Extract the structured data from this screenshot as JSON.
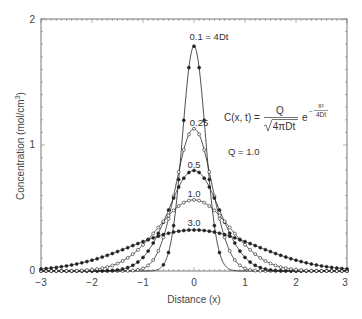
{
  "chart_data": {
    "type": "line",
    "title": "",
    "xlabel": "Distance (x)",
    "ylabel": "Concentration (mol/cm",
    "ylabel_sup": "3",
    "ylabel_end": ")",
    "xlim": [
      -3,
      3
    ],
    "ylim": [
      0,
      2
    ],
    "xticks": [
      -3,
      -2,
      -1,
      0,
      1,
      2,
      3
    ],
    "xtick_labels": [
      "−3",
      "−2",
      "−1",
      "0",
      "1",
      "2",
      "3"
    ],
    "yticks": [
      0,
      1,
      2
    ],
    "ytick_labels": [
      "0",
      "1",
      "2"
    ],
    "grid": false,
    "legend": "none (inline labels)",
    "formula": "C(x, t) = Q / sqrt(4πDt) · e^(−x²/4Dt)",
    "Q": 1.0,
    "series": [
      {
        "name": "0.1 = 4Dt",
        "s": 0.1,
        "peak": 1.784,
        "marker": "filled",
        "marker_step": 0.1
      },
      {
        "name": "0.25",
        "s": 0.25,
        "peak": 1.128,
        "marker": "open",
        "marker_step": 0.1
      },
      {
        "name": "0.5",
        "s": 0.5,
        "peak": 0.798,
        "marker": "filled",
        "marker_step": 0.1
      },
      {
        "name": "1.0",
        "s": 1.0,
        "peak": 0.564,
        "marker": "open",
        "marker_step": 0.1
      },
      {
        "name": "3.0",
        "s": 3.0,
        "peak": 0.326,
        "marker": "filled",
        "marker_step": 0.1
      }
    ]
  },
  "labels": {
    "s01": "0.1 = 4Dt",
    "s025": "0.25",
    "s05": "0.5",
    "s10": "1.0",
    "s30": "3.0",
    "q": "Q = 1.0",
    "eq_lhs": "C(x, t) =",
    "eq_num": "Q",
    "eq_den": "4πDt",
    "eq_e": "e",
    "eq_minus": "−",
    "eq_exp_num": "x²",
    "eq_exp_den": "4Dt"
  }
}
